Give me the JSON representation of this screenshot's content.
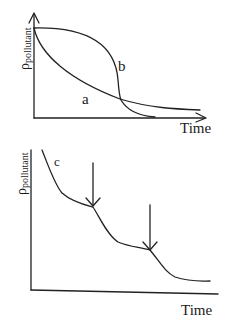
{
  "diagrams": [
    {
      "id": "top",
      "y_axis_label": "ρ",
      "y_axis_subscript": "pollutant",
      "x_axis_label": "Time",
      "curves": [
        {
          "name": "a",
          "label": "a",
          "description": "exponential-like gradual decay"
        },
        {
          "name": "b",
          "label": "b",
          "description": "slow initial decline then sharp drop, crossing curve a"
        }
      ]
    },
    {
      "id": "bottom",
      "y_axis_label": "ρ",
      "y_axis_subscript": "pollutant",
      "x_axis_label": "Time",
      "curves": [
        {
          "name": "c",
          "label": "c",
          "description": "stepwise decay with two marked transition points"
        }
      ],
      "arrows": 2
    }
  ]
}
